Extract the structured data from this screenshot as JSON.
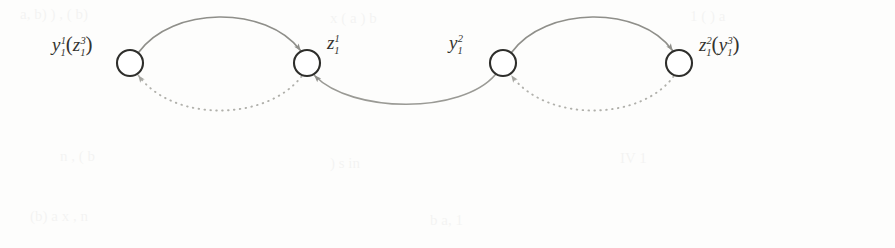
{
  "figure": {
    "name": "automaton-state-transition-diagram",
    "background_color": "#fdfdfc",
    "ink_color": "#34332f",
    "arc_color": "#8a8a86",
    "width": 895,
    "height": 248
  },
  "nodes": [
    {
      "id": "node-1",
      "cx": 130,
      "cy": 63,
      "r": 13,
      "label": "y₁¹(z₁³)",
      "label_base": "y",
      "label_sup": "1",
      "label_sub": "1",
      "label_paren_base": "z",
      "label_paren_sup": "3",
      "label_paren_sub": "1",
      "label_x": 52,
      "label_y": 32,
      "label_side": "left"
    },
    {
      "id": "node-2",
      "cx": 307,
      "cy": 63,
      "r": 13,
      "label": "z₁¹",
      "label_base": "z",
      "label_sup": "1",
      "label_sub": "1",
      "label_paren_base": "",
      "label_paren_sup": "",
      "label_paren_sub": "",
      "label_x": 327,
      "label_y": 32,
      "label_side": "right"
    },
    {
      "id": "node-3",
      "cx": 503,
      "cy": 63,
      "r": 13,
      "label": "y₁²",
      "label_base": "y",
      "label_sup": "2",
      "label_sub": "1",
      "label_paren_base": "",
      "label_paren_sup": "",
      "label_paren_sub": "",
      "label_x": 449,
      "label_y": 32,
      "label_side": "left"
    },
    {
      "id": "node-4",
      "cx": 679,
      "cy": 63,
      "r": 13,
      "label": "z₁²(y₁³)",
      "label_base": "z",
      "label_sup": "2",
      "label_sub": "1",
      "label_paren_base": "y",
      "label_paren_sup": "3",
      "label_paren_sub": "1",
      "label_x": 699,
      "label_y": 32,
      "label_side": "right"
    }
  ],
  "edges": [
    {
      "id": "edge-top-left",
      "from": "node-1",
      "to": "node-2",
      "style": "solid",
      "direction": "left-to-right",
      "curve": "arc-above",
      "arrowhead": "at-target"
    },
    {
      "id": "edge-bottom-left",
      "from": "node-2",
      "to": "node-1",
      "style": "dotted",
      "direction": "right-to-left",
      "curve": "arc-below",
      "arrowhead": "at-target"
    },
    {
      "id": "edge-middle",
      "from": "node-3",
      "to": "node-2",
      "style": "solid",
      "direction": "right-to-left",
      "curve": "arc-below",
      "arrowhead": "at-target"
    },
    {
      "id": "edge-top-right",
      "from": "node-3",
      "to": "node-4",
      "style": "solid",
      "direction": "left-to-right",
      "curve": "arc-above",
      "arrowhead": "at-target"
    },
    {
      "id": "edge-bottom-right",
      "from": "node-4",
      "to": "node-3",
      "style": "dotted",
      "direction": "right-to-left",
      "curve": "arc-below",
      "arrowhead": "at-target"
    }
  ]
}
